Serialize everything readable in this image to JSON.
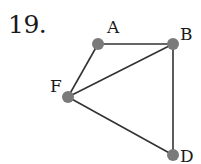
{
  "problem_number": "19.",
  "graph": {
    "nodes": [
      {
        "id": "A",
        "label": "A",
        "x": 98,
        "y": 44,
        "lx": 107,
        "ly": 33
      },
      {
        "id": "B",
        "label": "B",
        "x": 173,
        "y": 44,
        "lx": 180,
        "ly": 40
      },
      {
        "id": "F",
        "label": "F",
        "x": 68,
        "y": 97,
        "lx": 50,
        "ly": 92
      },
      {
        "id": "D",
        "label": "D",
        "x": 173,
        "y": 155,
        "lx": 180,
        "ly": 162
      }
    ],
    "edges": [
      [
        "A",
        "B"
      ],
      [
        "A",
        "F"
      ],
      [
        "F",
        "B"
      ],
      [
        "B",
        "D"
      ],
      [
        "F",
        "D"
      ]
    ],
    "colors": {
      "edge": "#333333",
      "node": "#7a7a7a"
    }
  }
}
